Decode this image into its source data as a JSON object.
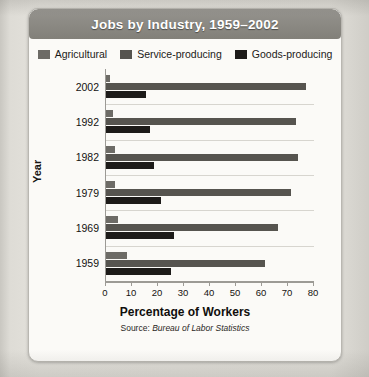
{
  "figure": {
    "title": "Jobs by Industry, 1959–2002",
    "x_axis_title": "Percentage of Workers",
    "y_axis_title": "Year",
    "source_prefix": "Source:",
    "source_name": "Bureau of Labor Statistics"
  },
  "colors": {
    "banner": "#8a8881",
    "banner_text": "#ffffff",
    "agricultural": "#6d6b66",
    "service": "#56544f",
    "goods": "#1d1b19",
    "axis": "#9c9a95",
    "grid": "#d7d5cf",
    "card": "#fbfaf7"
  },
  "chart_data": {
    "type": "bar",
    "orientation": "horizontal",
    "title": "Jobs by Industry, 1959–2002",
    "xlabel": "Percentage of Workers",
    "ylabel": "Year",
    "xlim": [
      0,
      80
    ],
    "xticks": [
      0,
      10,
      20,
      30,
      40,
      50,
      60,
      70,
      80
    ],
    "xtick_labels": [
      "0",
      "10",
      "20",
      "30",
      "40",
      "50",
      "60",
      "70",
      "80"
    ],
    "grid": true,
    "legend_position": "top-center",
    "categories": [
      "2002",
      "1992",
      "1982",
      "1979",
      "1969",
      "1959"
    ],
    "series": [
      {
        "name": "Agricultural",
        "color": "#6d6b66",
        "values": [
          1.5,
          2.5,
          3.5,
          3.5,
          4.5,
          8
        ]
      },
      {
        "name": "Service-producing",
        "color": "#56544f",
        "values": [
          77,
          73,
          74,
          71,
          66,
          61
        ]
      },
      {
        "name": "Goods-producing",
        "color": "#1d1b19",
        "values": [
          15.5,
          17,
          18.5,
          21,
          26,
          25
        ]
      }
    ],
    "annotation": "Source: Bureau of Labor Statistics"
  }
}
